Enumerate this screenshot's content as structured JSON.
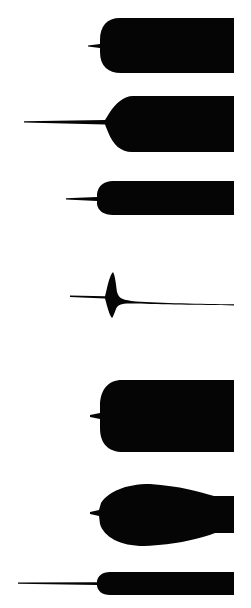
{
  "figure": {
    "kind": "silhouette-plate",
    "width": 251,
    "height": 608,
    "background_color": "#ffffff",
    "ink_color": "#050505",
    "specimen_count": 7
  },
  "specimens": [
    {
      "id": "specimen-1",
      "label": "1",
      "body_top": 18,
      "body_bottom": 73,
      "body_left": 100,
      "body_right": 234,
      "filament_tip_x": 88,
      "filament_axis_y": 46,
      "profile": "blunt rounded nose, straight parallel sides, very short stub filament",
      "path": "M 234 18 L 120 18 C 107 18 100 26 100 40 L 100 44 L 88 45.4 L 88 46.6 L 100 48 L 100 52 C 100 66 108 73 121 73 L 234 73 Z"
    },
    {
      "id": "specimen-2",
      "label": "2",
      "body_top": 96,
      "body_bottom": 152,
      "body_left": 104,
      "body_right": 234,
      "filament_tip_x": 24,
      "filament_axis_y": 122,
      "profile": "obliquely cut shoulder sloping down to the left, flaring abruptly from a long slender filament",
      "path": "M 234 96 L 133 96 C 124 96 116 103 110 112 L 105 120 L 24 121.2 L 24 122.6 L 105 124.5 L 108 132 C 113 145 121 152 132 152 L 234 152 Z"
    },
    {
      "id": "specimen-3",
      "label": "3",
      "body_top": 181,
      "body_bottom": 215,
      "body_left": 97,
      "body_right": 234,
      "filament_tip_x": 66,
      "filament_axis_y": 199,
      "profile": "narrow parallel-sided band with a rounded anterior tip and a short straight filament",
      "path": "M 234 181 L 113 181 C 104 181 98 186 97 194 L 97 197 L 66 198.2 L 66 199.4 L 97 201 L 97 204 C 98 211 104 215 113 215 L 234 215 Z"
    },
    {
      "id": "specimen-4",
      "label": "4",
      "body_top": 272,
      "body_bottom": 318,
      "body_left": 98,
      "body_right": 234,
      "filament_tip_x": 70,
      "filament_axis_y": 297,
      "profile": "slender fin-shaped swelling tapering gradually to a hairline on the right and crossed by a straight filament on the left",
      "path": "M 70 295.4 L 105 296.2 L 107 288 C 109 279 111 274 113 272 C 115 275 116 284 117 292 C 119 299 123 300 136 301.4 C 160 303 200 303.8 234 304.2 L 234 305.4 C 200 305.2 160 304.6 136 303.6 C 122 303 118 304 116 309 C 114 314 113 317 112 318 C 110 316 108 310 106 302 L 105 298.4 L 70 297 Z"
    },
    {
      "id": "specimen-5",
      "label": "5",
      "body_top": 380,
      "body_bottom": 452,
      "body_left": 100,
      "body_right": 234,
      "filament_tip_x": 90,
      "filament_axis_y": 417,
      "profile": "large deep block with broadly rounded corners, the tallest of the series, bearing a minute filament stub",
      "path": "M 234 380 L 122 380 C 108 380 100 390 100 406 L 100 413 L 90 415 L 90 417 L 100 419 L 100 428 C 100 444 109 452 123 452 L 234 452 Z"
    },
    {
      "id": "specimen-6",
      "label": "6",
      "body_top": 484,
      "body_bottom": 546,
      "body_left": 99,
      "body_right": 234,
      "filament_tip_x": 90,
      "filament_axis_y": 513,
      "profile": "ovoid body widest near the middle, narrowing to a constricted neck before the right edge",
      "path": "M 234 496 L 214 496 C 200 492 180 486 150 484 C 125 484 108 492 101 503 L 99 510 L 90 512 L 90 514 L 99 516 L 100 524 C 104 537 120 546 144 546 C 176 545 202 538 215 533 L 234 533 Z"
    },
    {
      "id": "specimen-7",
      "label": "7",
      "body_top": 572,
      "body_bottom": 595,
      "body_left": 97,
      "body_right": 234,
      "filament_tip_x": 18,
      "filament_axis_y": 583,
      "profile": "short narrow band with a rounded tip, carrying the longest and finest filament of the plate",
      "path": "M 234 572 L 110 572 C 102 572 98 576 97 581 L 97 582.2 L 18 582.6 L 18 583.8 L 97 585 L 97 586 C 98 591 102 595 110 595 L 234 595 Z"
    }
  ]
}
